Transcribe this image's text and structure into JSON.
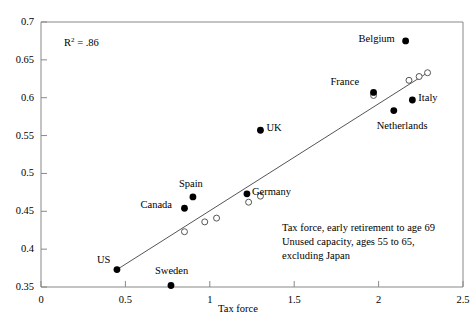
{
  "chart_data": {
    "type": "scatter",
    "title": "",
    "xlabel": "Tax force",
    "ylabel": "",
    "xlim": [
      0,
      2.5
    ],
    "ylim": [
      0.35,
      0.7
    ],
    "xticks": [
      "0",
      "0.5",
      "1",
      "1.5",
      "2",
      "2.5"
    ],
    "xtick_values": [
      0,
      0.5,
      1,
      1.5,
      2,
      2.5
    ],
    "yticks": [
      "0.35",
      "0.4",
      "0.45",
      "0.5",
      "0.55",
      "0.6",
      "0.65",
      "0.7"
    ],
    "ytick_values": [
      0.35,
      0.4,
      0.45,
      0.5,
      0.55,
      0.6,
      0.65,
      0.7
    ],
    "grid": false,
    "legend": "none",
    "series": [
      {
        "name": "countries",
        "marker": "filled-circle",
        "points": [
          {
            "label": "US",
            "x": 0.45,
            "y": 0.373,
            "label_dx": -20,
            "label_dy": -11
          },
          {
            "label": "Sweden",
            "x": 0.77,
            "y": 0.352,
            "label_dx": -16,
            "label_dy": -15
          },
          {
            "label": "Canada",
            "x": 0.85,
            "y": 0.454,
            "label_dx": -44,
            "label_dy": -4
          },
          {
            "label": "Spain",
            "x": 0.9,
            "y": 0.469,
            "label_dx": -14,
            "label_dy": -14
          },
          {
            "label": "Germany",
            "x": 1.22,
            "y": 0.473,
            "label_dx": 5,
            "label_dy": -3
          },
          {
            "label": "UK",
            "x": 1.3,
            "y": 0.557,
            "label_dx": 6,
            "label_dy": -3
          },
          {
            "label": "France",
            "x": 1.97,
            "y": 0.607,
            "label_dx": -43,
            "label_dy": -11
          },
          {
            "label": "Netherlands",
            "x": 2.09,
            "y": 0.583,
            "label_dx": -17,
            "label_dy": 14
          },
          {
            "label": "Italy",
            "x": 2.2,
            "y": 0.597,
            "label_dx": 6,
            "label_dy": -3
          },
          {
            "label": "Belgium",
            "x": 2.16,
            "y": 0.675,
            "label_dx": -47,
            "label_dy": -3
          }
        ]
      },
      {
        "name": "fitted values",
        "marker": "open-circle",
        "points": [
          {
            "x": 0.85,
            "y": 0.423
          },
          {
            "x": 0.97,
            "y": 0.436
          },
          {
            "x": 1.04,
            "y": 0.441
          },
          {
            "x": 1.23,
            "y": 0.462
          },
          {
            "x": 1.3,
            "y": 0.47
          },
          {
            "x": 1.97,
            "y": 0.603
          },
          {
            "x": 2.18,
            "y": 0.623
          },
          {
            "x": 2.24,
            "y": 0.628
          },
          {
            "x": 2.29,
            "y": 0.633
          }
        ]
      }
    ],
    "fit_line": {
      "name": "regression-line",
      "x0": 0.45,
      "y0": 0.373,
      "x1": 2.29,
      "y1": 0.633
    },
    "annotations": {
      "r_squared_prefix": "R",
      "r_squared_exponent": "2",
      "r_squared_value": "= .86",
      "caption_lines": [
        "Tax force, early retirement to age 69",
        "Unused capacity, ages 55 to 65,",
        "excluding Japan"
      ]
    },
    "colors": {
      "axis": "#888888",
      "marker_fill": "#000000",
      "marker_open_stroke": "#555555",
      "line": "#555555",
      "text": "#000000",
      "background": "#ffffff"
    }
  }
}
